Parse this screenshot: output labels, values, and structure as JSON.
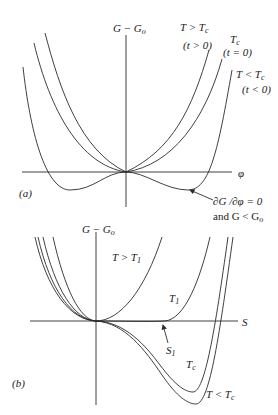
{
  "panel_a": {
    "tag": "(a)",
    "y_axis_label_main": "G − G",
    "y_axis_label_sub": "o",
    "x_axis_label": "φ",
    "curves": [
      {
        "name": "above-critical",
        "label_main": "T > T",
        "label_sub": "c",
        "condition": "(t > 0)"
      },
      {
        "name": "critical",
        "label_main": "T",
        "label_sub": "c",
        "condition": "(t = 0)"
      },
      {
        "name": "below-critical",
        "label_main": "T < T",
        "label_sub": "c",
        "condition": "(t < 0)"
      }
    ],
    "annotation": {
      "line1": "∂G /∂φ = 0",
      "line2_main": "and G < G",
      "line2_sub": "o"
    }
  },
  "panel_b": {
    "tag": "(b)",
    "y_axis_label_main": "G − G",
    "y_axis_label_sub": "o",
    "x_axis_label": "S",
    "curves": [
      {
        "name": "above-T1",
        "label_main": "T > T",
        "label_sub": "1"
      },
      {
        "name": "T1",
        "label_main": "T",
        "label_sub": "1"
      },
      {
        "name": "critical",
        "label_main": "T",
        "label_sub": "c"
      },
      {
        "name": "below-critical",
        "label_main": "T < T",
        "label_sub": "c"
      }
    ],
    "point_label_main": "S",
    "point_label_sub": "1"
  },
  "colors": {
    "line": "#2a2a2a",
    "background": "#ffffff"
  }
}
